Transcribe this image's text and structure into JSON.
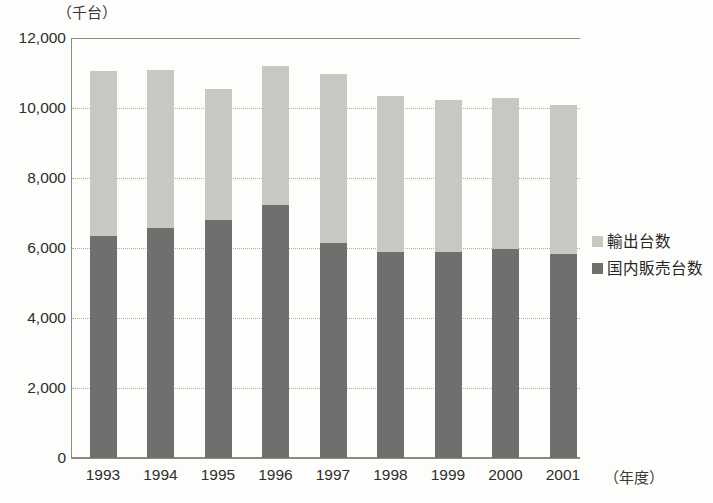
{
  "axis": {
    "unit_label": "（千台）",
    "x_unit_label": "（年度）",
    "y_ticks": [
      "12,000",
      "10,000",
      "8,000",
      "6,000",
      "4,000",
      "2,000",
      "0"
    ]
  },
  "legend": {
    "items": [
      {
        "label": "輸出台数",
        "color": "#c8c8c3"
      },
      {
        "label": "国内販売台数",
        "color": "#6f6f6d"
      }
    ]
  },
  "chart_data": {
    "type": "bar",
    "stacked": true,
    "title": "",
    "xlabel": "（年度）",
    "ylabel": "（千台）",
    "ylim": [
      0,
      12000
    ],
    "ytick_step": 2000,
    "grid": true,
    "legend_position": "right",
    "categories": [
      "1993",
      "1994",
      "1995",
      "1996",
      "1997",
      "1998",
      "1999",
      "2000",
      "2001"
    ],
    "series": [
      {
        "name": "国内販売台数",
        "color": "#6f6f6d",
        "values": [
          6350,
          6580,
          6800,
          7220,
          6130,
          5880,
          5880,
          5960,
          5820
        ]
      },
      {
        "name": "輸出台数",
        "color": "#c8c8c3",
        "values": [
          4700,
          4520,
          3740,
          3980,
          4830,
          4470,
          4350,
          4340,
          4260
        ]
      }
    ],
    "totals": [
      11050,
      11100,
      10540,
      11200,
      10960,
      10350,
      10230,
      10300,
      10080
    ]
  }
}
